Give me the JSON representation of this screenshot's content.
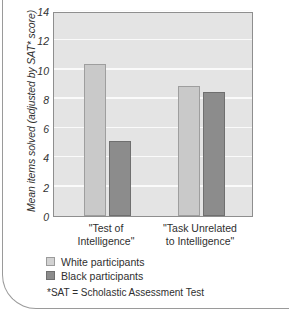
{
  "chart_data": {
    "type": "bar",
    "title": "",
    "xlabel": "",
    "ylabel": "Mean items solved (adjusted by SAT* score)",
    "ylim": [
      0,
      14
    ],
    "yticks": [
      0,
      2,
      4,
      6,
      8,
      10,
      12,
      14
    ],
    "grid": true,
    "legend_position": "below-axes-left",
    "categories": [
      "\"Test of Intelligence\"",
      "\"Task Unrelated to Intelligence\""
    ],
    "category_lines": [
      [
        "\"Test of",
        "Intelligence\""
      ],
      [
        "\"Task Unrelated",
        "to Intelligence\""
      ]
    ],
    "series": [
      {
        "name": "White participants",
        "color": "#c9c9c9",
        "values": [
          10.4,
          8.9
        ]
      },
      {
        "name": "Black participants",
        "color": "#8c8c8c",
        "values": [
          5.1,
          8.5
        ]
      }
    ],
    "annotations": [
      "*SAT = Scholastic Assessment Test"
    ]
  },
  "legend": {
    "items": [
      {
        "label": "White participants"
      },
      {
        "label": "Black participants"
      }
    ]
  },
  "footnote": "*SAT = Scholastic Assessment Test"
}
